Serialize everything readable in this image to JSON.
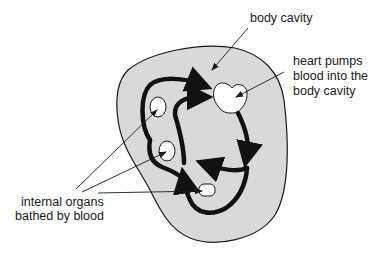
{
  "diagram": {
    "type": "open-circulatory-system",
    "colors": {
      "background": "#ffffff",
      "body_cavity_fill": "#d9d9d9",
      "outline": "#1a1a1a",
      "organ_fill": "#ffffff",
      "blood_flow_arrows": "#111111"
    },
    "labels": {
      "body_cavity": "body cavity",
      "heart": [
        "heart pumps",
        "blood into the",
        "body cavity"
      ],
      "organs": [
        "internal organs",
        "bathed by blood"
      ]
    },
    "parts": {
      "body_cavity": "body cavity (shaded region)",
      "heart": "heart",
      "organs": [
        "organ-upper-left",
        "organ-middle-left",
        "organ-bottom"
      ]
    }
  }
}
